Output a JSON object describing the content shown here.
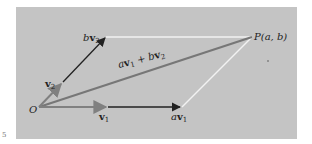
{
  "diagram": {
    "title": "",
    "background_color": "#c4c4c4",
    "colors": {
      "basis_vector": "#808080",
      "scaled_vector": "#222222",
      "sum_vector": "#777777",
      "parallelogram_edge": "#f2f2f2"
    },
    "points": {
      "origin": {
        "label": "O",
        "x": 39,
        "y": 107
      },
      "P": {
        "label": "P(a, b)",
        "x": 252,
        "y": 37
      }
    },
    "vectors": [
      {
        "id": "v1",
        "label_main": "v",
        "label_sub": "1",
        "from": [
          39,
          107
        ],
        "to": [
          108,
          107
        ]
      },
      {
        "id": "v2",
        "label_main": "v",
        "label_sub": "2",
        "from": [
          39,
          107
        ],
        "to": [
          62,
          83
        ]
      },
      {
        "id": "av1",
        "coef": "a",
        "label_main": "v",
        "label_sub": "1",
        "from": [
          108,
          107
        ],
        "to": [
          182,
          107
        ]
      },
      {
        "id": "bv2",
        "coef": "b",
        "label_main": "v",
        "label_sub": "2",
        "from": [
          62,
          83
        ],
        "to": [
          106,
          37
        ]
      },
      {
        "id": "sum",
        "from": [
          39,
          107
        ],
        "to": [
          252,
          37
        ]
      }
    ],
    "sum_label": {
      "a": "a",
      "v1": "v",
      "sub1": "1",
      "plus": " + ",
      "b": "b",
      "v2": "v",
      "sub2": "2"
    },
    "labels": {
      "O": "O",
      "P": "P(a, b)"
    },
    "page_marker": "5"
  }
}
